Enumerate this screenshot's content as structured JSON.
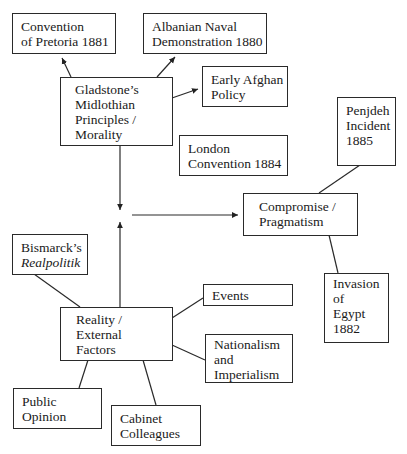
{
  "diagram": {
    "type": "concept-map",
    "nodes": {
      "pretoria": {
        "lines": [
          "Convention",
          "of Pretoria 1881"
        ]
      },
      "albanian": {
        "lines": [
          "Albanian Naval",
          "Demonstration 1880"
        ]
      },
      "gladstone": {
        "lines": [
          "Gladstone’s",
          "Midlothian",
          "Principles /",
          "Morality"
        ]
      },
      "afghan": {
        "lines": [
          "Early Afghan",
          "Policy"
        ]
      },
      "london": {
        "lines": [
          "London",
          "Convention 1884"
        ]
      },
      "penjdeh": {
        "lines": [
          "Penjdeh",
          "Incident",
          "1885"
        ]
      },
      "compromise": {
        "lines": [
          "Compromise /",
          "Pragmatism"
        ]
      },
      "bismarck": {
        "lines": [
          "Bismarck’s",
          "Realpolitik"
        ]
      },
      "reality": {
        "lines": [
          "Reality /",
          "External",
          "Factors"
        ]
      },
      "events": {
        "lines": [
          "Events"
        ]
      },
      "nationalism": {
        "lines": [
          "Nationalism",
          "and",
          "Imperialism"
        ]
      },
      "egypt": {
        "lines": [
          "Invasion",
          "of",
          "Egypt",
          "1882"
        ]
      },
      "public": {
        "lines": [
          "Public",
          "Opinion"
        ]
      },
      "cabinet": {
        "lines": [
          "Cabinet",
          "Colleagues"
        ]
      }
    },
    "edges": [
      {
        "from": "gladstone",
        "to": "pretoria",
        "arrow": true
      },
      {
        "from": "gladstone",
        "to": "albanian",
        "arrow": true
      },
      {
        "from": "gladstone",
        "to": "afghan",
        "arrow": true
      },
      {
        "from": "gladstone",
        "to": "center",
        "arrow": true
      },
      {
        "from": "reality",
        "to": "center",
        "arrow": true
      },
      {
        "from": "center",
        "to": "compromise",
        "arrow": true
      },
      {
        "from": "compromise",
        "to": "penjdeh",
        "arrow": false
      },
      {
        "from": "compromise",
        "to": "egypt",
        "arrow": false
      },
      {
        "from": "reality",
        "to": "bismarck",
        "arrow": false
      },
      {
        "from": "reality",
        "to": "events",
        "arrow": false
      },
      {
        "from": "reality",
        "to": "nationalism",
        "arrow": false
      },
      {
        "from": "reality",
        "to": "public",
        "arrow": false
      },
      {
        "from": "reality",
        "to": "cabinet",
        "arrow": false
      }
    ]
  }
}
